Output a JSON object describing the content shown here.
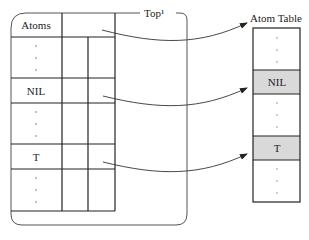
{
  "diagram": {
    "top_label": "Top¹",
    "table_title": "Atom Table",
    "left_rows": [
      {
        "label": "Atoms",
        "kind": "text"
      },
      {
        "label": ":",
        "kind": "dots"
      },
      {
        "label": "NIL",
        "kind": "text"
      },
      {
        "label": ":",
        "kind": "dots"
      },
      {
        "label": "T",
        "kind": "text"
      },
      {
        "label": ":",
        "kind": "dots"
      }
    ],
    "table_rows": [
      {
        "label": "",
        "kind": "dots",
        "highlight": false
      },
      {
        "label": "NIL",
        "kind": "text",
        "highlight": true
      },
      {
        "label": "",
        "kind": "dots",
        "highlight": false
      },
      {
        "label": "T",
        "kind": "text",
        "highlight": true
      },
      {
        "label": "",
        "kind": "dots",
        "highlight": false
      }
    ],
    "arrows": [
      {
        "from": "Atoms",
        "to": "Atom Table"
      },
      {
        "from": "NIL",
        "to": "NIL"
      },
      {
        "from": "T",
        "to": "T"
      }
    ],
    "colors": {
      "line": "#222222",
      "highlight": "#d9d9d9"
    }
  }
}
